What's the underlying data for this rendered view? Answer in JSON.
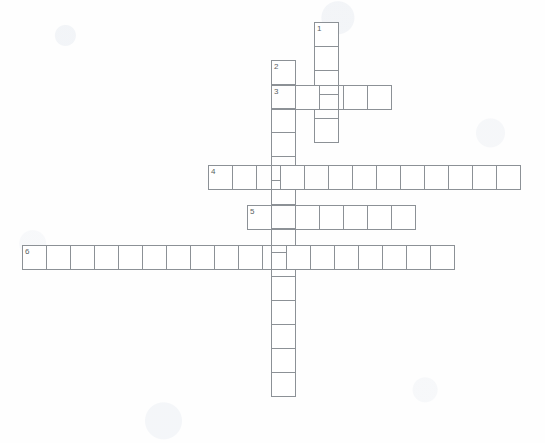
{
  "puzzle": {
    "title": "Crossword Puzzle Grid",
    "cell_size_px": 25,
    "grid_color": "#8c9196",
    "cell_fill": "#ffffff",
    "background": "#fefefe",
    "number_color": "#5a5f64"
  },
  "entries": [
    {
      "number": "1",
      "direction": "down",
      "length": 5,
      "x": 314,
      "y": 22,
      "cells": [
        "",
        "",
        "",
        "",
        ""
      ],
      "crossing_indices": [
        3
      ]
    },
    {
      "number": "2",
      "direction": "down",
      "length": 14,
      "x": 271,
      "y": 60,
      "cells": [
        "",
        "",
        "",
        "",
        "",
        "",
        "",
        "",
        "",
        "",
        "",
        "",
        "",
        ""
      ],
      "crossing_indices": [
        1,
        4,
        6,
        7
      ]
    },
    {
      "number": "3",
      "direction": "across",
      "length": 5,
      "x": 271,
      "y": 85,
      "cells": [
        "",
        "",
        "",
        "",
        ""
      ],
      "crossing_indices": [
        0,
        2
      ]
    },
    {
      "number": "4",
      "direction": "across",
      "length": 13,
      "x": 208,
      "y": 165,
      "cells": [
        "",
        "",
        "",
        "",
        "",
        "",
        "",
        "",
        "",
        "",
        "",
        "",
        ""
      ],
      "crossing_indices": [
        2,
        4
      ]
    },
    {
      "number": "5",
      "direction": "across",
      "length": 7,
      "x": 247,
      "y": 205,
      "cells": [
        "",
        "",
        "",
        "",
        "",
        "",
        ""
      ],
      "crossing_indices": [
        1
      ]
    },
    {
      "number": "6",
      "direction": "across",
      "length": 18,
      "x": 22,
      "y": 245,
      "cells": [
        "",
        "",
        "",
        "",
        "",
        "",
        "",
        "",
        "",
        "",
        "",
        "",
        "",
        "",
        "",
        "",
        "",
        ""
      ],
      "crossing_indices": [
        10
      ]
    }
  ]
}
